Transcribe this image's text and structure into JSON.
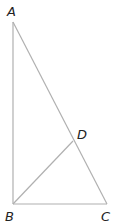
{
  "diagram": {
    "type": "geometry",
    "line_color": "#b0b0b0",
    "label_color": "#222222",
    "points": {
      "A": {
        "label": "A",
        "x": 13,
        "y": 22
      },
      "B": {
        "label": "B",
        "x": 13,
        "y": 204
      },
      "C": {
        "label": "C",
        "x": 107,
        "y": 204
      },
      "D": {
        "label": "D",
        "x": 73,
        "y": 141
      }
    },
    "segments": [
      [
        "A",
        "B"
      ],
      [
        "A",
        "C"
      ],
      [
        "B",
        "C"
      ],
      [
        "B",
        "D"
      ]
    ]
  }
}
